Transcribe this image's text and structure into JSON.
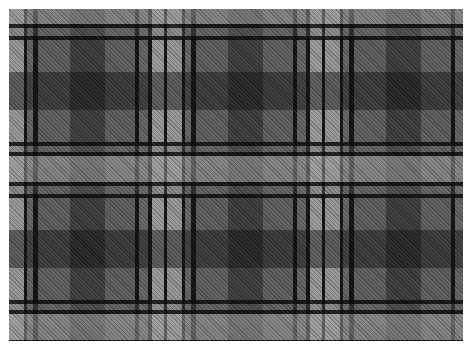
{
  "image": {
    "subject": "Grey tartan plaid fabric swatch",
    "alt": "Grey and black tartan plaid woven fabric",
    "background_color": "#ffffff",
    "colors": {
      "base_grey": "#5e5e5e",
      "light_grey": "#a0a0a0",
      "dark_band": "#2a2a2a",
      "black_line": "#0a0a0a"
    },
    "pattern": {
      "type": "tartan",
      "weave": "twill",
      "repeat_px": 158
    }
  }
}
